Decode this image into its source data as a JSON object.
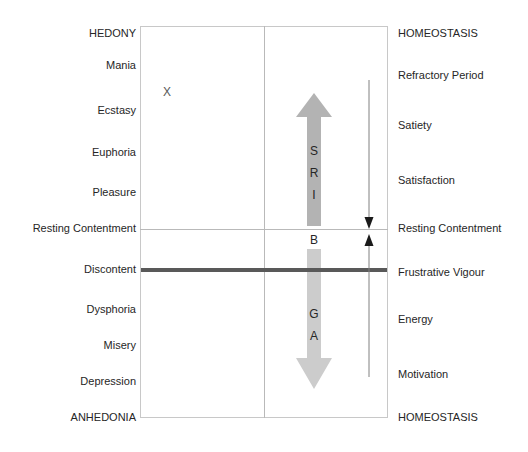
{
  "diagram": {
    "marker": "X",
    "axes": {
      "left_top_pole": "HEDONY",
      "left_bottom_pole": "ANHEDONIA",
      "right_top_pole": "HOMEOSTASIS",
      "right_bottom_pole": "HOMEOSTASIS",
      "midline_label": "Resting Contentment"
    },
    "left_labels": [
      {
        "text": "HEDONY",
        "y": 27
      },
      {
        "text": "Mania",
        "y": 59
      },
      {
        "text": "Ecstasy",
        "y": 104
      },
      {
        "text": "Euphoria",
        "y": 146
      },
      {
        "text": "Pleasure",
        "y": 186
      },
      {
        "text": "Resting Contentment",
        "y": 222
      },
      {
        "text": "Discontent",
        "y": 263
      },
      {
        "text": "Dysphoria",
        "y": 303
      },
      {
        "text": "Misery",
        "y": 339
      },
      {
        "text": "Depression",
        "y": 375
      },
      {
        "text": "ANHEDONIA",
        "y": 411
      }
    ],
    "right_labels": [
      {
        "text": "HOMEOSTASIS",
        "y": 27
      },
      {
        "text": "Refractory Period",
        "y": 69
      },
      {
        "text": "Satiety",
        "y": 119
      },
      {
        "text": "Satisfaction",
        "y": 174
      },
      {
        "text": "Resting Contentment",
        "y": 222
      },
      {
        "text": "Frustrative Vigour",
        "y": 266
      },
      {
        "text": "Energy",
        "y": 313
      },
      {
        "text": "Motivation",
        "y": 368
      },
      {
        "text": "HOMEOSTASIS",
        "y": 411
      }
    ],
    "up_arrow": {
      "name": "SRI",
      "letters": [
        "S",
        "R",
        "I"
      ],
      "color": "#b3b3b3"
    },
    "down_arrow": {
      "name": "GA",
      "letters": [
        "G",
        "A"
      ],
      "color": "#cccccc"
    },
    "between_arrows_letter": "B",
    "baseline_bar_color": "#595959",
    "thin_arrow_color": "#808080",
    "box_border_color": "#c8c8c8"
  }
}
